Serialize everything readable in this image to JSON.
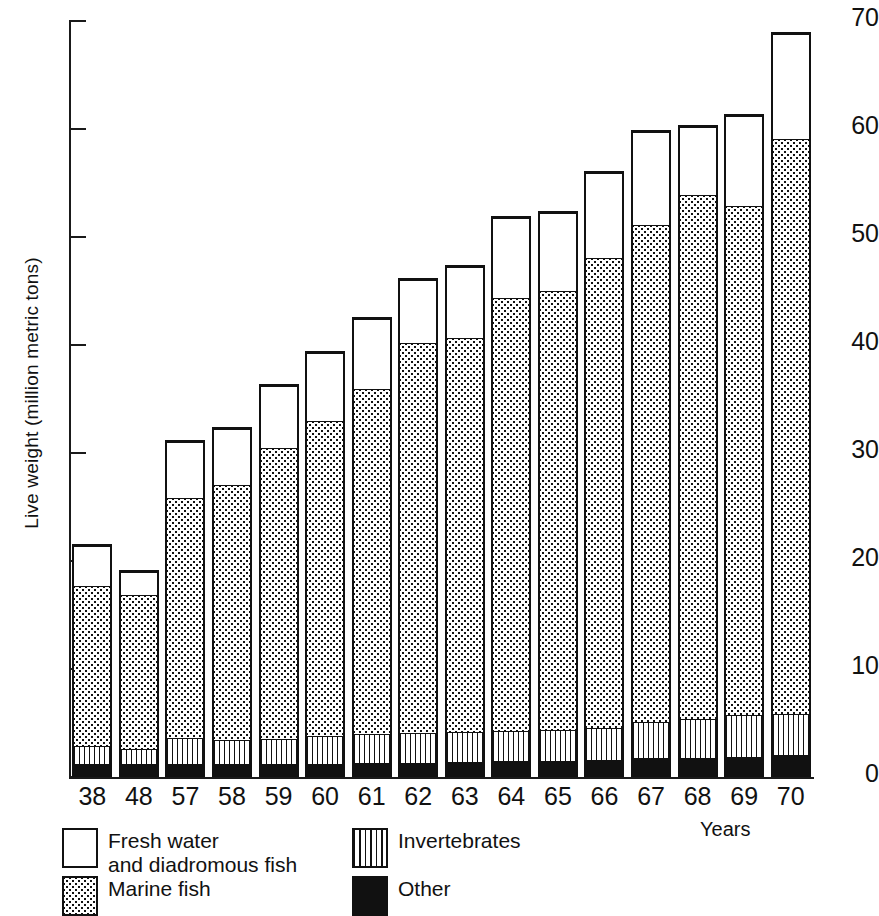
{
  "chart_data": {
    "type": "bar",
    "subtype": "stacked-vertical",
    "title": "",
    "xlabel": "Years",
    "ylabel": "Live weight (million metric tons)",
    "ylim": [
      0,
      70
    ],
    "yticks": [
      0,
      10,
      20,
      30,
      40,
      50,
      60,
      70
    ],
    "ytick_labels": [
      "0",
      "10",
      "20",
      "30",
      "40",
      "50",
      "60",
      "70"
    ],
    "grid": false,
    "legend_position": "below-plot",
    "categories": [
      "38",
      "48",
      "57",
      "58",
      "59",
      "60",
      "61",
      "62",
      "63",
      "64",
      "65",
      "66",
      "67",
      "68",
      "69",
      "70"
    ],
    "series": [
      {
        "name": "Other",
        "pattern": "solid-black",
        "color": "#111111",
        "values": [
          1.0,
          1.0,
          1.0,
          1.0,
          1.0,
          1.0,
          1.1,
          1.1,
          1.2,
          1.3,
          1.3,
          1.4,
          1.6,
          1.6,
          1.7,
          1.9
        ]
      },
      {
        "name": "Invertebrates",
        "pattern": "vertical-stripes",
        "color": "#ffffff",
        "values": [
          1.7,
          1.5,
          2.5,
          2.3,
          2.4,
          2.6,
          2.7,
          2.8,
          2.8,
          2.8,
          2.9,
          3.0,
          3.3,
          3.6,
          3.9,
          3.8
        ]
      },
      {
        "name": "Marine fish",
        "pattern": "dotted",
        "color": "#ffffff",
        "values": [
          15.1,
          14.5,
          22.5,
          23.9,
          27.2,
          29.5,
          32.3,
          36.4,
          36.8,
          40.4,
          40.9,
          43.8,
          46.3,
          48.8,
          47.4,
          53.5
        ]
      },
      {
        "name": "Fresh water\nand diadromous fish",
        "pattern": "white",
        "color": "#ffffff",
        "values": [
          3.8,
          2.2,
          5.2,
          5.2,
          5.8,
          6.3,
          6.5,
          5.9,
          6.6,
          7.4,
          7.3,
          7.9,
          8.7,
          6.4,
          8.4,
          9.8
        ]
      }
    ],
    "totals": [
      21.6,
      19.2,
      31.2,
      32.4,
      36.4,
      39.4,
      42.6,
      46.2,
      47.4,
      51.9,
      52.4,
      56.1,
      59.9,
      60.4,
      61.4,
      69.0
    ],
    "annotations": []
  },
  "axis": {
    "y_label": "Live weight (million metric tons)",
    "x_label": "Years",
    "y_ticks": [
      {
        "label": "70",
        "value": 70
      },
      {
        "label": "60",
        "value": 60
      },
      {
        "label": "50",
        "value": 50
      },
      {
        "label": "40",
        "value": 40
      },
      {
        "label": "30",
        "value": 30
      },
      {
        "label": "20",
        "value": 20
      },
      {
        "label": "10",
        "value": 10
      },
      {
        "label": "0",
        "value": 0
      }
    ]
  },
  "legend": {
    "items": [
      {
        "key": "fresh",
        "label": "Fresh water\nand diadromous  fish",
        "swatch": "outline-white-swatch"
      },
      {
        "key": "marine",
        "label": "Marine fish",
        "swatch": "dotted-swatch"
      },
      {
        "key": "invertebrates",
        "label": "Invertebrates",
        "swatch": "striped-swatch"
      },
      {
        "key": "other",
        "label": "Other",
        "swatch": "solid-black-swatch"
      }
    ]
  }
}
